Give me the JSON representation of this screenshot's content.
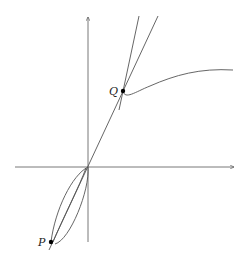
{
  "figure": {
    "points": [
      {
        "label": "P",
        "x": 51,
        "y": 242
      },
      {
        "label": "Q",
        "x": 123,
        "y": 91
      }
    ],
    "labels": {
      "P": "P",
      "Q": "Q"
    },
    "colors": {
      "stroke": "#555555",
      "point": "#000000"
    }
  }
}
